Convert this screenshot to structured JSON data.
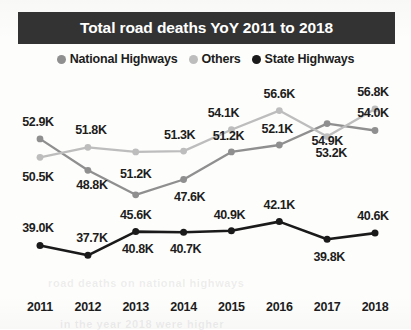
{
  "title": "Total road deaths YoY 2011 to 2018",
  "legend": {
    "items": [
      {
        "label": "National Highways",
        "color": "#8f8f8f"
      },
      {
        "label": "Others",
        "color": "#bdbdbd"
      },
      {
        "label": "State Highways",
        "color": "#1a1a1a"
      }
    ]
  },
  "background_ghost": [
    "road deaths on national highways",
    "in the year 2018 were higher"
  ],
  "chart_data": {
    "type": "line",
    "title": "Total road deaths YoY 2011 to 2018",
    "xlabel": "",
    "ylabel": "",
    "unit": "K",
    "grid": false,
    "legend_position": "top",
    "categories": [
      "2011",
      "2012",
      "2013",
      "2014",
      "2015",
      "2016",
      "2017",
      "2018"
    ],
    "ylim": [
      35.0,
      58.5
    ],
    "series": [
      {
        "name": "National Highways",
        "color": "#8f8f8f",
        "values": [
          52.9,
          48.8,
          45.6,
          47.6,
          51.2,
          52.1,
          54.9,
          54.0
        ],
        "labels": [
          "52.9K",
          "48.8K",
          "45.6K",
          "47.6K",
          "51.2K",
          "52.1K",
          "54.9K",
          "54.0K"
        ],
        "label_offsets": [
          {
            "dx": -2,
            "dy": -17
          },
          {
            "dx": 4,
            "dy": 15
          },
          {
            "dx": 0,
            "dy": 20
          },
          {
            "dx": 6,
            "dy": 18
          },
          {
            "dx": -3,
            "dy": -16
          },
          {
            "dx": -2,
            "dy": -16
          },
          {
            "dx": 0,
            "dy": 17
          },
          {
            "dx": -2,
            "dy": -17
          }
        ]
      },
      {
        "name": "Others",
        "color": "#bdbdbd",
        "values": [
          50.5,
          51.8,
          51.2,
          51.3,
          54.1,
          56.6,
          53.2,
          56.8
        ],
        "labels": [
          "50.5K",
          "51.8K",
          "51.2K",
          "51.3K",
          "54.1K",
          "56.6K",
          "53.2K",
          "56.8K"
        ],
        "label_offsets": [
          {
            "dx": -2,
            "dy": 20
          },
          {
            "dx": 3,
            "dy": -17
          },
          {
            "dx": 0,
            "dy": 22
          },
          {
            "dx": -4,
            "dy": -16
          },
          {
            "dx": -8,
            "dy": -17
          },
          {
            "dx": 0,
            "dy": -17
          },
          {
            "dx": 4,
            "dy": 16
          },
          {
            "dx": -2,
            "dy": -17
          }
        ]
      },
      {
        "name": "State Highways",
        "color": "#1a1a1a",
        "values": [
          39.0,
          37.7,
          40.8,
          40.7,
          40.9,
          42.1,
          39.8,
          40.6
        ],
        "labels": [
          "39.0K",
          "37.7K",
          "40.8K",
          "40.7K",
          "40.9K",
          "42.1K",
          "39.8K",
          "40.6K"
        ],
        "label_offsets": [
          {
            "dx": -2,
            "dy": -17
          },
          {
            "dx": 4,
            "dy": -17
          },
          {
            "dx": 2,
            "dy": 17
          },
          {
            "dx": 2,
            "dy": 17
          },
          {
            "dx": -2,
            "dy": -16
          },
          {
            "dx": 0,
            "dy": -17
          },
          {
            "dx": 2,
            "dy": 18
          },
          {
            "dx": -2,
            "dy": -17
          }
        ]
      }
    ]
  }
}
